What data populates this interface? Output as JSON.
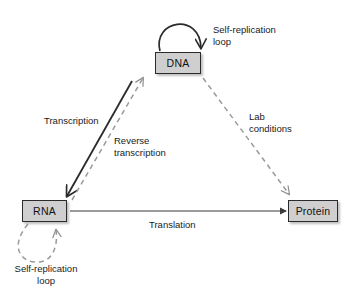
{
  "diagram": {
    "background_color": "#ffffff",
    "node_fill_color": "#cfcfcf",
    "node_border_color": "#2b2b2b",
    "solid_edge_color": "#3a3a3a",
    "dashed_edge_color": "#9a9a9a",
    "nodes": {
      "dna": {
        "label": "DNA"
      },
      "rna": {
        "label": "RNA"
      },
      "protein": {
        "label": "Protein"
      }
    },
    "labels": {
      "dna_self_replication": "Self-replication\nloop",
      "transcription": "Transcription",
      "reverse_transcription": "Reverse\ntranscription",
      "lab_conditions": "Lab\nconditions",
      "translation": "Translation",
      "rna_self_replication": "Self-replication\nloop"
    },
    "edges": [
      {
        "name": "dna-self-replication-loop",
        "from": "DNA",
        "to": "DNA",
        "style": "solid",
        "label": "Self-replication loop"
      },
      {
        "name": "transcription-edge",
        "from": "DNA",
        "to": "RNA",
        "style": "solid",
        "label": "Transcription"
      },
      {
        "name": "reverse-transcription-edge",
        "from": "RNA",
        "to": "DNA",
        "style": "dashed",
        "label": "Reverse transcription"
      },
      {
        "name": "lab-conditions-edge",
        "from": "DNA",
        "to": "Protein",
        "style": "dashed",
        "label": "Lab conditions"
      },
      {
        "name": "translation-edge",
        "from": "RNA",
        "to": "Protein",
        "style": "solid",
        "label": "Translation"
      },
      {
        "name": "rna-self-replication-loop",
        "from": "RNA",
        "to": "RNA",
        "style": "dashed",
        "label": "Self-replication loop"
      }
    ]
  }
}
